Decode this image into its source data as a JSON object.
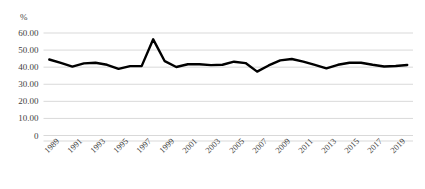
{
  "chart_data": {
    "type": "line",
    "title": "",
    "xlabel": "",
    "ylabel": "%",
    "ylim": [
      0,
      60
    ],
    "grid": true,
    "legend": "none",
    "y_ticks": [
      "0",
      "10.00",
      "20.00",
      "30.00",
      "40.00",
      "50.00",
      "60.00"
    ],
    "y_tick_values": [
      0,
      10,
      20,
      30,
      40,
      50,
      60
    ],
    "x_tick_labels": [
      "1989",
      "1991",
      "1993",
      "1995",
      "1997",
      "1999",
      "2001",
      "2003",
      "2005",
      "2007",
      "2009",
      "2011",
      "2013",
      "2015",
      "2017",
      "2019"
    ],
    "x": [
      1989,
      1990,
      1991,
      1992,
      1993,
      1994,
      1995,
      1996,
      1997,
      1998,
      1999,
      2000,
      2001,
      2002,
      2003,
      2004,
      2005,
      2006,
      2007,
      2008,
      2009,
      2010,
      2011,
      2012,
      2013,
      2014,
      2015,
      2016,
      2017,
      2018,
      2019,
      2020
    ],
    "values": [
      44.5,
      42.5,
      40.3,
      42.2,
      42.6,
      41.4,
      39.0,
      40.6,
      40.6,
      56.3,
      43.5,
      40.1,
      41.7,
      41.7,
      41.2,
      41.4,
      43.2,
      42.4,
      37.4,
      41.0,
      44.0,
      44.8,
      43.2,
      41.3,
      39.3,
      41.4,
      42.6,
      42.6,
      41.4,
      40.4,
      40.7,
      41.3
    ],
    "series_name": "percent",
    "line_color": "#000000",
    "line_width": 2.4,
    "grid_color": "#d9d9d9",
    "background": "#ffffff"
  },
  "axis": {
    "unit_label": "%"
  }
}
